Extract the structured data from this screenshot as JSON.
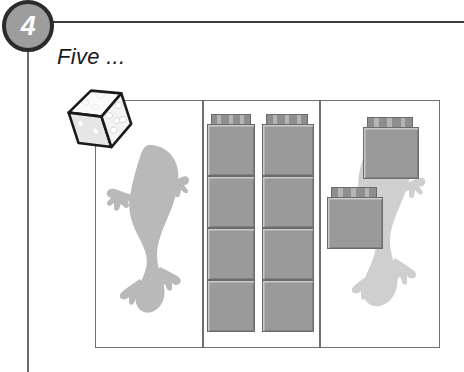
{
  "step": {
    "number": "4",
    "caption": "Five ..."
  },
  "colors": {
    "badge_fill": "#9d9d9d",
    "badge_ring": "#2b2b2b",
    "badge_text": "#ffffff",
    "rule": "#3c3c3c",
    "frame_border": "#6e6e6e",
    "brick_face": "#9a9a9a",
    "brick_outline": "#6b6b6b",
    "brick_highlight": "#c9c9c9",
    "gecko_left": "#b9b9b9",
    "gecko_right": "#cfcfcf",
    "die_face": "#f2f2f2",
    "die_outline": "#1a1a1a",
    "die_pip": "#ffffff"
  },
  "die": {
    "name": "five-pip-die",
    "pips_shown": 5,
    "rotation_deg": -18
  },
  "panels": [
    {
      "name": "panel-gecko-outline",
      "label": "",
      "gecko": {
        "shade": "#b9b9b9",
        "name": "gecko-silhouette"
      },
      "bricks": []
    },
    {
      "name": "panel-brick-stacks",
      "label": "",
      "gecko": null,
      "stacks": [
        {
          "name": "brick-stack-left",
          "count": 4
        },
        {
          "name": "brick-stack-right",
          "count": 4
        }
      ]
    },
    {
      "name": "panel-gecko-with-bricks",
      "label": "",
      "gecko": {
        "shade": "#cfcfcf",
        "name": "gecko-silhouette"
      },
      "bricks": [
        {
          "name": "floating-brick-upper"
        },
        {
          "name": "floating-brick-lower"
        }
      ]
    }
  ]
}
